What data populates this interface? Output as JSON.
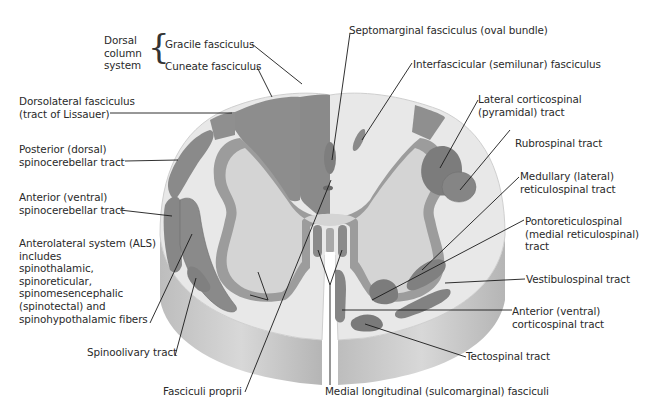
{
  "diagram": {
    "colors": {
      "tract": "#8a8a8a",
      "tract_dark": "#7a7a7a",
      "white_matter": "#e6e6e6",
      "gray_matter": "#d3d3d3",
      "gray_rim": "#9c9c9c",
      "side_shade": "#c4c4c4",
      "leader": "#1a1a1a",
      "text": "#2a2a2a"
    },
    "group": {
      "label_lines": [
        "Dorsal",
        "column",
        "system"
      ]
    },
    "labels": {
      "gracile": [
        "Gracile fasciculus"
      ],
      "cuneate": [
        "Cuneate fasciculus"
      ],
      "septomarginal": [
        "Septomarginal fasciculus (oval bundle)"
      ],
      "interfascicular": [
        "Interfascicular (semilunar) fasciculus"
      ],
      "dorsolateral": [
        "Dorsolateral fasciculus",
        "(tract of Lissauer)"
      ],
      "lateral_corticospinal": [
        "Lateral corticospinal",
        "(pyramidal) tract"
      ],
      "rubrospinal": [
        "Rubrospinal tract"
      ],
      "posterior_spinocerebellar": [
        "Posterior (dorsal)",
        "spinocerebellar tract"
      ],
      "medullary_reticulospinal": [
        "Medullary (lateral)",
        "reticulospinal tract"
      ],
      "anterior_spinocerebellar": [
        "Anterior (ventral)",
        "spinocerebellar tract"
      ],
      "pontoreticulospinal": [
        "Pontoreticulospinal",
        "(medial reticulospinal)",
        "tract"
      ],
      "als": [
        "Anterolateral system (ALS)",
        "includes",
        "spinothalamic,",
        "spinoreticular,",
        "spinomesencephalic",
        "(spinotectal) and",
        "spinohypothalamic fibers"
      ],
      "vestibulospinal": [
        "Vestibulospinal tract"
      ],
      "anterior_corticospinal": [
        "Anterior (ventral)",
        "corticospinal tract"
      ],
      "spinoolivary": [
        "Spinoolivary tract"
      ],
      "tectospinal": [
        "Tectospinal tract"
      ],
      "fasciculi_proprii": [
        "Fasciculi proprii"
      ],
      "medial_longitudinal": [
        "Medial longitudinal (sulcomarginal) fasciculi"
      ]
    }
  }
}
